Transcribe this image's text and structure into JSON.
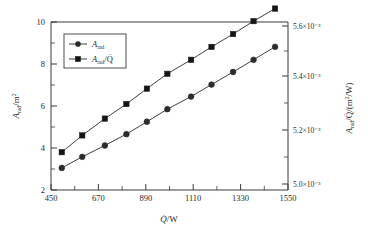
{
  "chart_data": {
    "type": "line",
    "title": "",
    "xlabel": "Q̇/W",
    "ylabel": "A_rad/m²",
    "y2label": "A_rad/Q̇/(m²/W)",
    "xlim": [
      450,
      1550
    ],
    "ylim": [
      2,
      10
    ],
    "y2lim": [
      0.005,
      0.0056
    ],
    "xticks": [
      450,
      670,
      890,
      1110,
      1330,
      1550
    ],
    "xticklabels": [
      "450",
      "670",
      "890",
      "1110",
      "1330",
      "1550"
    ],
    "yticks": [
      2,
      4,
      6,
      8,
      10
    ],
    "yticklabels": [
      "2",
      "4",
      "6",
      "8",
      "10"
    ],
    "y2ticks": [
      0.005,
      0.0052,
      0.0054,
      0.0056
    ],
    "y2ticklabels": [
      "5.0×10⁻³",
      "5.2×10⁻³",
      "5.4×10⁻³",
      "5.6×10⁻³"
    ],
    "grid": false,
    "legend_position": "upper-left",
    "x": [
      500,
      595,
      700,
      800,
      895,
      990,
      1100,
      1195,
      1295,
      1390,
      1490
    ],
    "series": [
      {
        "name": "A_rad",
        "marker": "circle",
        "axis": "left",
        "values": [
          3.05,
          3.58,
          4.12,
          4.66,
          5.25,
          5.85,
          6.45,
          7.02,
          7.62,
          8.2,
          8.82
        ]
      },
      {
        "name": "A_rad/Q̇",
        "marker": "square",
        "axis": "right",
        "values": [
          0.005135,
          0.005195,
          0.005255,
          0.005307,
          0.005362,
          0.005415,
          0.005465,
          0.005511,
          0.005557,
          0.005603,
          0.005648
        ]
      }
    ],
    "colors": {
      "series1": "#2b2b2b",
      "series2": "#151515",
      "axis": "#3a3a3a",
      "background": "#ffffff"
    }
  },
  "legend": {
    "entries": [
      {
        "label_base": "A",
        "label_sub": "rad",
        "label_tail": "",
        "marker": "circle"
      },
      {
        "label_base": "A",
        "label_sub": "rad",
        "label_tail": "/Q̇",
        "marker": "square"
      }
    ]
  },
  "axes": {
    "x_label_base": "Q̇",
    "x_label_tail": "/W",
    "y_label_base": "A",
    "y_label_sub": "rad",
    "y_label_tail": "/m",
    "y_label_sup": "2",
    "y2_label_base": "A",
    "y2_label_sub": "rad",
    "y2_label_tail": "/Q̇/(m",
    "y2_label_sup": "2",
    "y2_label_tail2": "/W)"
  }
}
